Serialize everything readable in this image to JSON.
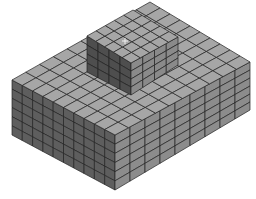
{
  "figure": {
    "title": "Hexahedral finite element mesh of stepped block",
    "colors": {
      "background": "#ffffff",
      "top_face": "#a6a6a6",
      "left_face": "#5e5e5e",
      "right_face": "#8c8c8c",
      "block_left_face": "#4e4e4e",
      "block_right_face": "#8a8a8a",
      "mesh_line": "#222222",
      "cursor_marker": "#f0f0f0"
    },
    "base": {
      "top": {
        "left": [
          12,
          80
        ],
        "back": [
          150,
          2
        ],
        "right": [
          250,
          62
        ],
        "front": [
          115,
          135
        ]
      },
      "height": 55,
      "divisions": {
        "length": 10,
        "width": 9,
        "depth": 6
      }
    },
    "raised_block": {
      "top": {
        "left": [
          87,
          36
        ],
        "back": [
          133,
          10
        ],
        "right": [
          178,
          37
        ],
        "front": [
          131,
          63
        ]
      },
      "height": 32,
      "divisions": {
        "length": 4,
        "width": 4,
        "depth": 4
      }
    },
    "cursor_marker": {
      "x": 125,
      "y": 41,
      "symbol": "+"
    }
  }
}
